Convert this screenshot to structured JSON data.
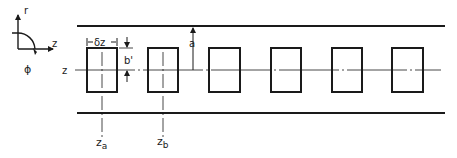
{
  "diagram": {
    "colors": {
      "ink": "#1a1a1a",
      "background": "#ffffff"
    },
    "axes_legend": {
      "r_label": "r",
      "z_label": "z",
      "phi_label": "ϕ"
    },
    "labels": {
      "axis_z": "z",
      "delta_z": "δz",
      "b_prime": "b'",
      "a": "a",
      "z_a_main": "z",
      "z_a_sub": "a",
      "z_b_main": "z",
      "z_b_sub": "b"
    },
    "waveguide": {
      "top_wall_y": 26,
      "bottom_wall_y": 113,
      "x_start": 77,
      "x_end": 445,
      "centerline_y": 70
    },
    "slots": [
      {
        "x": 87,
        "y": 48,
        "w": 30,
        "h": 44
      },
      {
        "x": 148,
        "y": 48,
        "w": 30,
        "h": 44
      },
      {
        "x": 209,
        "y": 48,
        "w": 31,
        "h": 44
      },
      {
        "x": 271,
        "y": 48,
        "w": 30,
        "h": 44
      },
      {
        "x": 332,
        "y": 48,
        "w": 30,
        "h": 44
      },
      {
        "x": 392,
        "y": 48,
        "w": 31,
        "h": 44
      }
    ]
  }
}
